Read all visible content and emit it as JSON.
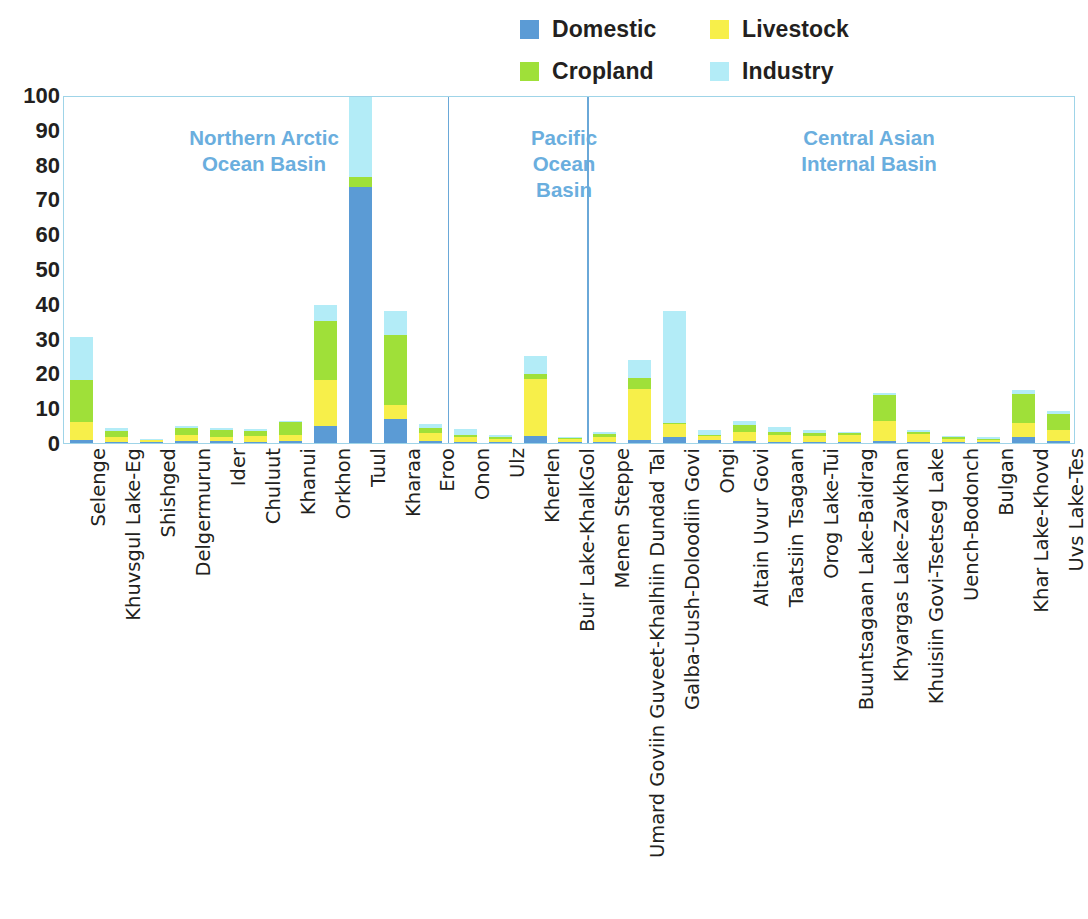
{
  "legend": {
    "items": [
      {
        "label": "Domestic",
        "color": "#5b9bd5",
        "icon": "legend-swatch-domestic"
      },
      {
        "label": "Livestock",
        "color": "#f7ef4a",
        "icon": "legend-swatch-livestock"
      },
      {
        "label": "Cropland",
        "color": "#9fe039",
        "icon": "legend-swatch-cropland"
      },
      {
        "label": "Industry",
        "color": "#b3ecf7",
        "icon": "legend-swatch-industry"
      }
    ]
  },
  "axis": {
    "yticks": [
      "100",
      "90",
      "80",
      "70",
      "60",
      "50",
      "40",
      "30",
      "20",
      "10",
      "0"
    ]
  },
  "groups": [
    {
      "title": "Northern Arctic\nOcean Basin",
      "start": 0,
      "count": 11
    },
    {
      "title": "Pacific\nOcean\nBasin",
      "start": 11,
      "count": 4
    },
    {
      "title": "Central Asian\nInternal Basin",
      "start": 15,
      "count": 14
    }
  ],
  "chart_data": {
    "type": "bar",
    "subtype": "stacked",
    "title": "",
    "xlabel": "",
    "ylabel": "",
    "ylim": [
      0,
      100
    ],
    "yticks": [
      0,
      10,
      20,
      30,
      40,
      50,
      60,
      70,
      80,
      90,
      100
    ],
    "grid": false,
    "legend_position": "top-right",
    "categories": [
      "Selenge",
      "Khuvsgul Lake-Eg",
      "Shishged",
      "Delgermurun",
      "Ider",
      "Chuluut",
      "Khanui",
      "Orkhon",
      "Tuul",
      "Kharaa",
      "Eroo",
      "Onon",
      "Ulz",
      "Kherlen",
      "Buir Lake-KhalkGol",
      "Menen Steppe",
      "Umard Goviin Guveet-Khalhiin Dundad Tal",
      "Galba-Uush-Doloodiin Govi",
      "Ongi",
      "Altain Uvur Govi",
      "Taatsiin Tsagaan",
      "Orog Lake-Tui",
      "Buuntsagaan Lake-Baidrag",
      "Khyargas Lake-Zavkhan",
      "Khuisiin Govi-Tsetseg Lake",
      "Uench-Bodonch",
      "Bulgan",
      "Khar Lake-Khovd",
      "Uvs Lake-Tes"
    ],
    "series": [
      {
        "name": "Domestic",
        "color": "#5b9bd5",
        "values": [
          1.0,
          0.4,
          0.2,
          0.6,
          0.5,
          0.3,
          0.5,
          5.0,
          73.5,
          7.0,
          0.6,
          0.4,
          0.3,
          2.0,
          0.3,
          0.4,
          0.9,
          1.6,
          0.8,
          0.6,
          0.4,
          0.4,
          0.4,
          0.7,
          0.4,
          0.3,
          0.3,
          1.6,
          0.6
        ]
      },
      {
        "name": "Livestock",
        "color": "#f7ef4a",
        "values": [
          5.0,
          1.4,
          0.6,
          1.6,
          1.3,
          1.6,
          1.9,
          13.0,
          0.0,
          4.0,
          2.4,
          1.4,
          1.0,
          16.5,
          0.9,
          1.2,
          14.6,
          4.0,
          1.1,
          2.6,
          1.9,
          1.7,
          1.9,
          5.6,
          2.2,
          0.9,
          0.6,
          4.2,
          3.0
        ]
      },
      {
        "name": "Cropland",
        "color": "#9fe039",
        "values": [
          12.0,
          1.6,
          0.2,
          2.0,
          1.9,
          1.5,
          3.6,
          17.0,
          3.0,
          20.0,
          1.4,
          0.6,
          0.3,
          1.3,
          0.2,
          1.0,
          3.2,
          0.2,
          0.4,
          2.0,
          0.9,
          0.7,
          0.5,
          7.4,
          0.7,
          0.4,
          0.4,
          8.2,
          4.6
        ]
      },
      {
        "name": "Industry",
        "color": "#b3ecf7",
        "values": [
          12.5,
          0.8,
          0.2,
          0.6,
          0.7,
          0.5,
          0.3,
          4.8,
          22.9,
          7.0,
          1.0,
          1.5,
          0.6,
          5.2,
          0.3,
          0.6,
          5.3,
          32.2,
          1.5,
          1.1,
          1.4,
          0.9,
          0.5,
          0.7,
          0.5,
          0.3,
          0.3,
          1.3,
          1.1
        ]
      }
    ]
  }
}
